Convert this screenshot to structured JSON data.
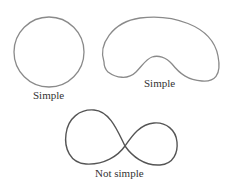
{
  "figure": {
    "shapes": [
      {
        "id": "circle",
        "kind": "simple closed curve",
        "label": "Simple"
      },
      {
        "id": "kidney",
        "kind": "simple closed curve",
        "label": "Simple"
      },
      {
        "id": "figure-eight",
        "kind": "self-intersecting closed curve",
        "label": "Not simple"
      }
    ]
  },
  "colors": {
    "stroke_light": "#8a8a8a",
    "stroke_dark": "#555555",
    "label": "#333333",
    "background": "#ffffff"
  }
}
